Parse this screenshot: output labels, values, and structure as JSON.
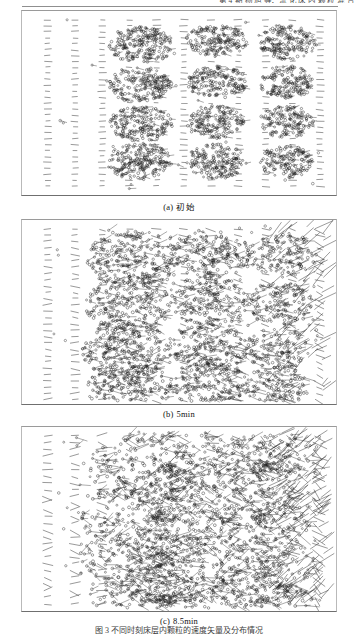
{
  "page": {
    "running_head": "第 4 期        杨 旭 等：流 化 床 内 颗 粒 混 合",
    "figure_caption": "图 3   不同时刻床层内颗粒的速度矢量及分布情况"
  },
  "figure": {
    "panels": [
      {
        "id": "a",
        "label": "(a)",
        "caption": "初始",
        "time_min": 0,
        "description": "initial packed state: three dense compact particle clusters, short horizontal tick vectors elsewhere",
        "cluster_count": 3,
        "dispersion": "low"
      },
      {
        "id": "b",
        "label": "(b)",
        "caption": "5min",
        "time_min": 5,
        "description": "partially mixed: clusters loosened, longer inclined velocity vectors appear on right side",
        "cluster_count": 3,
        "dispersion": "medium"
      },
      {
        "id": "c",
        "label": "(c)",
        "caption": "8.5min",
        "time_min": 8.5,
        "description": "well mixed: particles dispersed across bed, strong diagonal velocity vectors at right wall",
        "cluster_count": 2,
        "dispersion": "high"
      }
    ],
    "columns": 11,
    "colors": {
      "particle": "#1d1d1d",
      "vector": "#2b2b2b",
      "frame": "#8d8d8d",
      "paper": "#ffffff"
    }
  }
}
